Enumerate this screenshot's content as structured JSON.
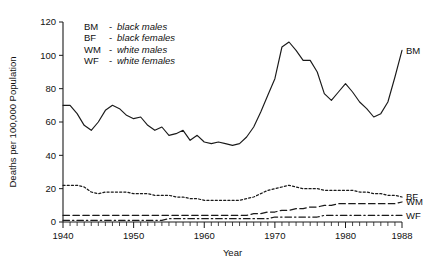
{
  "chart_data": {
    "type": "line",
    "title": "",
    "xlabel": "Year",
    "ylabel": "Deaths per 100,000 Population",
    "xlim": [
      1940,
      1988
    ],
    "ylim": [
      0,
      120
    ],
    "grid": false,
    "legend_position": "upper-left inside plot",
    "xticks": [
      "1940",
      "1950",
      "1960",
      "1970",
      "1980",
      "1988"
    ],
    "xtick_values": [
      1940,
      1950,
      1960,
      1970,
      1980,
      1988
    ],
    "yticks": [
      "0",
      "20",
      "40",
      "60",
      "80",
      "100",
      "120"
    ],
    "ytick_values": [
      0,
      20,
      40,
      60,
      80,
      100,
      120
    ],
    "minor_xticks": "every year 1940-1988",
    "x": [
      1940,
      1941,
      1942,
      1943,
      1944,
      1945,
      1946,
      1947,
      1948,
      1949,
      1950,
      1951,
      1952,
      1953,
      1954,
      1955,
      1956,
      1957,
      1958,
      1959,
      1960,
      1961,
      1962,
      1963,
      1964,
      1965,
      1966,
      1967,
      1968,
      1969,
      1970,
      1971,
      1972,
      1973,
      1974,
      1975,
      1976,
      1977,
      1978,
      1979,
      1980,
      1981,
      1982,
      1983,
      1984,
      1985,
      1986,
      1987,
      1988
    ],
    "series": [
      {
        "name": "BM",
        "label": "BM",
        "description": "black males",
        "linestyle": "solid",
        "values": [
          70,
          70,
          65,
          58,
          55,
          60,
          67,
          70,
          68,
          64,
          62,
          63,
          58,
          55,
          57,
          52,
          53,
          55,
          49,
          52,
          48,
          47,
          48,
          47,
          46,
          47,
          51,
          57,
          66,
          76,
          86,
          105,
          108,
          103,
          97,
          97,
          90,
          77,
          73,
          78,
          83,
          78,
          72,
          68,
          63,
          65,
          72,
          87,
          103
        ]
      },
      {
        "name": "BF",
        "label": "BF",
        "description": "black females",
        "linestyle": "dotted",
        "values": [
          22,
          22,
          22,
          21,
          18,
          17,
          18,
          18,
          18,
          18,
          17,
          17,
          17,
          16,
          16,
          16,
          15,
          15,
          14,
          14,
          13,
          13,
          13,
          13,
          13,
          13,
          14,
          15,
          17,
          19,
          20,
          21,
          22,
          21,
          20,
          20,
          20,
          19,
          19,
          19,
          19,
          19,
          18,
          18,
          17,
          17,
          16,
          16,
          15
        ]
      },
      {
        "name": "WM",
        "label": "WM",
        "description": "white males",
        "linestyle": "dashed",
        "values": [
          4,
          4,
          4,
          4,
          4,
          4,
          4,
          4,
          4,
          4,
          4,
          4,
          4,
          4,
          4,
          4,
          4,
          4,
          4,
          4,
          4,
          4,
          4,
          4,
          4,
          4,
          4,
          5,
          5,
          6,
          6,
          7,
          7,
          8,
          8,
          9,
          9,
          10,
          10,
          11,
          11,
          11,
          11,
          11,
          11,
          11,
          11,
          11,
          12
        ]
      },
      {
        "name": "WF",
        "label": "WF",
        "description": "white females",
        "linestyle": "dashdot",
        "values": [
          1,
          1,
          1,
          1,
          1,
          1,
          1,
          1,
          1,
          1,
          1,
          1,
          1,
          1,
          1,
          2,
          2,
          2,
          2,
          2,
          2,
          2,
          2,
          2,
          2,
          2,
          2,
          2,
          2,
          2,
          3,
          3,
          3,
          3,
          3,
          3,
          3,
          4,
          4,
          4,
          4,
          4,
          4,
          4,
          4,
          4,
          4,
          4,
          4
        ]
      }
    ]
  },
  "legend": {
    "separator": "-",
    "rows": [
      {
        "code": "BM",
        "desc": "black males"
      },
      {
        "code": "BF",
        "desc": "black females"
      },
      {
        "code": "WM",
        "desc": "white males"
      },
      {
        "code": "WF",
        "desc": "white females"
      }
    ]
  },
  "colors": {
    "ink": "#1a1a1a",
    "background": "#ffffff"
  }
}
